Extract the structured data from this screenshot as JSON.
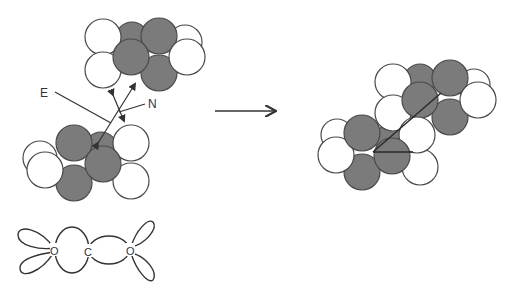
{
  "figure": {
    "labels": {
      "e_label": "E",
      "n_label": "N",
      "o_left": "O",
      "c_center": "C",
      "o_right": "O"
    },
    "colors": {
      "atom_white": "#ffffff",
      "atom_gray": "#7b7b7b",
      "outline": "#4a4a4a",
      "line": "#3a3a3a"
    },
    "reaction_arrow": {
      "from": [
        215,
        111
      ],
      "to": [
        277,
        111
      ]
    }
  }
}
